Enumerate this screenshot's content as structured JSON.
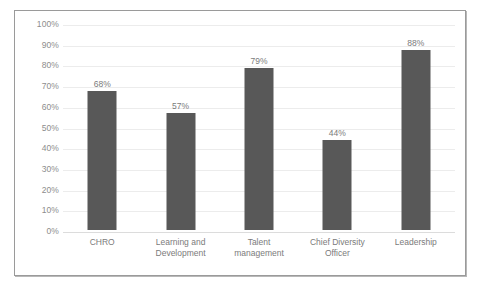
{
  "chart_data": {
    "type": "bar",
    "title": "",
    "subtitle": "",
    "xlabel": "",
    "ylabel": "",
    "categories": [
      "CHRO",
      "Learning and Development",
      "Talent management",
      "Chief Diversity Officer",
      "Leadership"
    ],
    "category_lines": [
      [
        "CHRO",
        ""
      ],
      [
        "Learning and",
        "Development"
      ],
      [
        "Talent",
        "management"
      ],
      [
        "Chief Diversity",
        "Officer"
      ],
      [
        "Leadership",
        ""
      ]
    ],
    "values": [
      68,
      57,
      79,
      44,
      88
    ],
    "value_labels": [
      "68%",
      "57%",
      "79%",
      "44%",
      "88%"
    ],
    "ylim": [
      0,
      100
    ],
    "ytick_values": [
      100,
      90,
      80,
      70,
      60,
      50,
      40,
      30,
      20,
      10,
      0
    ],
    "ytick_labels": [
      "100%",
      "90%",
      "80%",
      "70%",
      "60%",
      "50%",
      "40%",
      "30%",
      "20%",
      "10%",
      "0%"
    ],
    "grid": true,
    "legend": false,
    "legend_position": "none",
    "colors": {
      "bar": "#585858",
      "gridline": "#ececec",
      "axis": "#dcdcdc",
      "tick_text": "#8d8d8d",
      "label_text": "#7b7b7b",
      "frame_border": "#9a9a9a",
      "background": "#ffffff"
    }
  }
}
